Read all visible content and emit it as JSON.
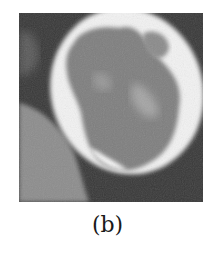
{
  "figure": {
    "caption": "(b)",
    "colors": {
      "background_dark": "#333333",
      "lower_left_tissue": "#8a8a8a",
      "rim_bright": "#f5f5f5",
      "interior_gray": "#7c7c7c",
      "interior_light": "#a8a8a8"
    }
  }
}
